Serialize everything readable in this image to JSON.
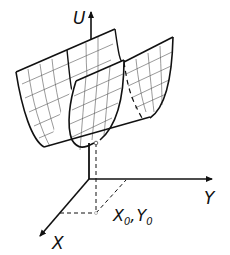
{
  "diagram": {
    "type": "3d-potential-surface",
    "axes": {
      "vertical_label": "U",
      "horizontal_label": "Y",
      "depth_label": "X"
    },
    "point_label": {
      "x": "X",
      "x_sub": "0",
      "sep": ",",
      "y": "Y",
      "y_sub": "0"
    },
    "colors": {
      "line": "#111111",
      "grid": "#444444",
      "background": "#ffffff"
    }
  }
}
